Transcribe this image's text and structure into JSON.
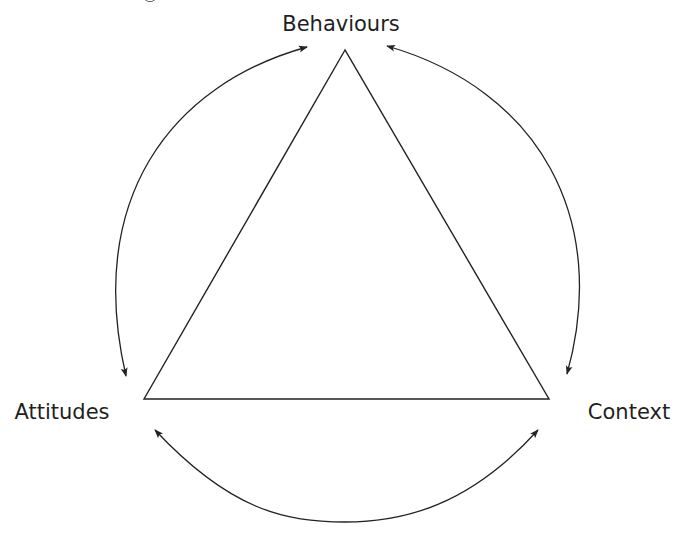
{
  "diagram": {
    "type": "triangle-relationship",
    "colors": {
      "background": "#ffffff",
      "stroke": "#222222",
      "text": "#1f1f1f"
    },
    "nodes": [
      {
        "id": "behaviours",
        "label": "Behaviours",
        "position": "top"
      },
      {
        "id": "attitudes",
        "label": "Attitudes",
        "position": "bottom-left"
      },
      {
        "id": "context",
        "label": "Context",
        "position": "bottom-right"
      }
    ],
    "edges": [
      {
        "from": "behaviours",
        "to": "attitudes",
        "direction": "bidirectional",
        "side": "left"
      },
      {
        "from": "behaviours",
        "to": "context",
        "direction": "bidirectional",
        "side": "right"
      },
      {
        "from": "attitudes",
        "to": "context",
        "direction": "bidirectional",
        "side": "bottom"
      }
    ],
    "center_shape": "triangle"
  }
}
